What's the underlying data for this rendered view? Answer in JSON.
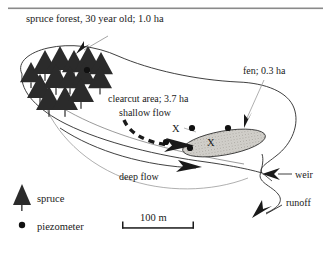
{
  "figure": {
    "kind": "catchment-map-diagram",
    "background_color": "#ffffff",
    "ink_color": "#1a1a1a",
    "top_rule_color": "#8a8a8a",
    "fen_fill_color": "#d0cec9",
    "tree_fill_color": "#2b2b2b"
  },
  "labels": {
    "title": "spruce forest, 30 year old; 1.0 ha",
    "fen": "fen; 0.3 ha",
    "clearcut": "clearcut area; 3.7 ha",
    "shallow_flow": "shallow flow",
    "deep_flow": "deep flow",
    "weir": "weir",
    "runoff": "runoff",
    "x_outer": "X",
    "x_inner": "X"
  },
  "legend": {
    "items": [
      {
        "symbol": "spruce-tree-icon",
        "label": "spruce"
      },
      {
        "symbol": "piezometer-dot-icon",
        "label": "piezometer"
      }
    ]
  },
  "scale_bar": {
    "label": "100 m",
    "x_start": 122,
    "x_end": 194,
    "y": 228
  },
  "areas": [
    {
      "name": "spruce forest",
      "value": 1.0,
      "unit": "ha",
      "age_years": 30
    },
    {
      "name": "clearcut area",
      "value": 3.7,
      "unit": "ha"
    },
    {
      "name": "fen",
      "value": 0.3,
      "unit": "ha"
    }
  ],
  "trees": [
    {
      "x": 31,
      "y": 62,
      "s": 11
    },
    {
      "x": 45,
      "y": 50,
      "s": 13
    },
    {
      "x": 60,
      "y": 46,
      "s": 13
    },
    {
      "x": 74,
      "y": 50,
      "s": 12
    },
    {
      "x": 88,
      "y": 46,
      "s": 14
    },
    {
      "x": 101,
      "y": 52,
      "s": 12
    },
    {
      "x": 40,
      "y": 74,
      "s": 13
    },
    {
      "x": 56,
      "y": 64,
      "s": 13
    },
    {
      "x": 70,
      "y": 66,
      "s": 12
    },
    {
      "x": 84,
      "y": 62,
      "s": 12
    },
    {
      "x": 100,
      "y": 66,
      "s": 12
    },
    {
      "x": 49,
      "y": 86,
      "s": 13
    },
    {
      "x": 65,
      "y": 86,
      "s": 13
    },
    {
      "x": 81,
      "y": 78,
      "s": 13
    }
  ],
  "piezometers": [
    {
      "x": 87,
      "y": 70
    },
    {
      "x": 192,
      "y": 128
    },
    {
      "x": 228,
      "y": 128
    },
    {
      "x": 190,
      "y": 148
    },
    {
      "x": 166,
      "y": 142
    }
  ]
}
